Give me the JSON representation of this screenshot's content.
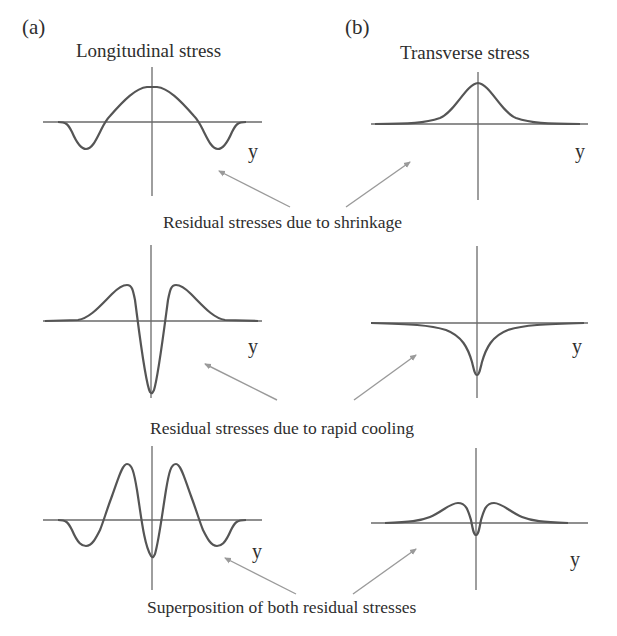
{
  "panels": {
    "a": {
      "letter": "(a)",
      "title": "Longitudinal stress"
    },
    "b": {
      "letter": "(b)",
      "title": "Transverse stress"
    }
  },
  "axis_label": "y",
  "captions": {
    "shrinkage": "Residual stresses due to shrinkage",
    "rapid_cooling": "Residual stresses due to rapid cooling",
    "superposition": "Superposition of both residual stresses"
  },
  "colors": {
    "curve": "#555555",
    "axis": "#6a6a6a",
    "arrow": "#9a9a9a",
    "text": "#2e2e2e",
    "background": "#ffffff"
  },
  "rows": [
    {
      "name": "shrinkage",
      "longitudinal": "central tensile peak with compressive dips on both sides",
      "transverse": "single bell-shaped tensile peak"
    },
    {
      "name": "rapid_cooling",
      "longitudinal": "deep central compressive spike flanked by two tensile humps",
      "transverse": "sharp central compressive cusp"
    },
    {
      "name": "superposition",
      "longitudinal": "two tall tensile peaks, central compressive dip, outer compressive dips",
      "transverse": "two small tensile humps with small central compressive dip"
    }
  ]
}
